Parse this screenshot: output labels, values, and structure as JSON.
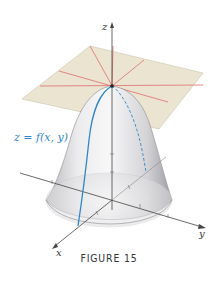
{
  "figure": {
    "caption": "FIGURE 15",
    "surface_label": "z = f(x, y)",
    "axes": {
      "x": "x",
      "y": "y",
      "z": "z"
    },
    "colors": {
      "plane_fill": "#e9e3cf",
      "plane_lines": "#e07a78",
      "surface_curve": "#2f86c6",
      "axis": "#444444",
      "surface_shade": "#d8d8da"
    }
  }
}
